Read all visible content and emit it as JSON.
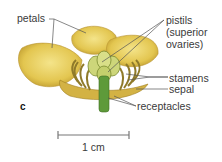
{
  "labels": {
    "petals": "petals",
    "pistils_line1": "pistils",
    "pistils_line2": "(superior",
    "pistils_line3": "ovaries)",
    "stamens": "stamens",
    "sepal": "sepal",
    "receptacles": "receptacles",
    "panel": "c"
  },
  "scale_bar": {
    "label": "1 cm"
  },
  "colors": {
    "petal": "#e8cf5a",
    "petal_shade": "#c9a836",
    "stamen": "#8f7a2a",
    "stem": "#5e9a3a",
    "leader": "#555555"
  }
}
